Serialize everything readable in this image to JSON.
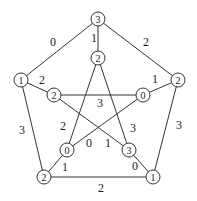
{
  "graph": {
    "nodes": [
      {
        "id": "o_top",
        "x": 98,
        "y": 19,
        "label": "3"
      },
      {
        "id": "o_left",
        "x": 21,
        "y": 80,
        "label": "1"
      },
      {
        "id": "o_right",
        "x": 178,
        "y": 80,
        "label": "2"
      },
      {
        "id": "o_bl",
        "x": 44,
        "y": 177,
        "label": "2"
      },
      {
        "id": "o_br",
        "x": 153,
        "y": 177,
        "label": "1"
      },
      {
        "id": "i_top",
        "x": 98,
        "y": 58,
        "label": "2"
      },
      {
        "id": "i_left",
        "x": 54,
        "y": 95,
        "label": "2"
      },
      {
        "id": "i_right",
        "x": 143,
        "y": 95,
        "label": "0"
      },
      {
        "id": "i_bl",
        "x": 67,
        "y": 150,
        "label": "0"
      },
      {
        "id": "i_br",
        "x": 129,
        "y": 150,
        "label": "3"
      }
    ],
    "edges": [
      {
        "from": "o_top",
        "to": "o_left",
        "label": "0",
        "lx": 53,
        "ly": 42
      },
      {
        "from": "o_top",
        "to": "o_right",
        "label": "2",
        "lx": 146,
        "ly": 42
      },
      {
        "from": "o_left",
        "to": "o_bl",
        "label": "3",
        "lx": 22,
        "ly": 130
      },
      {
        "from": "o_right",
        "to": "o_br",
        "label": "3",
        "lx": 179,
        "ly": 125
      },
      {
        "from": "o_bl",
        "to": "o_br",
        "label": "2",
        "lx": 101,
        "ly": 188
      },
      {
        "from": "o_top",
        "to": "i_top",
        "label": "1",
        "lx": 94,
        "ly": 38
      },
      {
        "from": "o_left",
        "to": "i_left",
        "label": "2",
        "lx": 42,
        "ly": 80
      },
      {
        "from": "o_right",
        "to": "i_right",
        "label": "1",
        "lx": 155,
        "ly": 79
      },
      {
        "from": "o_bl",
        "to": "i_bl",
        "label": "1",
        "lx": 65,
        "ly": 167
      },
      {
        "from": "o_br",
        "to": "i_br",
        "label": "0",
        "lx": 135,
        "ly": 166
      },
      {
        "from": "i_left",
        "to": "i_right",
        "label": "3",
        "lx": 100,
        "ly": 103
      },
      {
        "from": "i_top",
        "to": "i_bl",
        "label": "2",
        "lx": 63,
        "ly": 126
      },
      {
        "from": "i_top",
        "to": "i_br",
        "label": "3",
        "lx": 133,
        "ly": 128
      },
      {
        "from": "i_right",
        "to": "i_bl",
        "label": "0",
        "lx": 89,
        "ly": 143
      },
      {
        "from": "i_left",
        "to": "i_br",
        "label": "1",
        "lx": 108,
        "ly": 143
      }
    ]
  }
}
